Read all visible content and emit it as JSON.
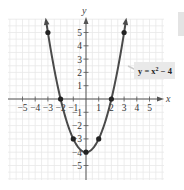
{
  "chart_data": {
    "type": "line",
    "title": "",
    "function": "y = x^2 - 4",
    "xlabel": "x",
    "ylabel": "y",
    "xlim": [
      -5,
      5
    ],
    "ylim": [
      -5,
      5
    ],
    "grid": true,
    "x_ticks": [
      -5,
      -4,
      -3,
      -2,
      -1,
      1,
      2,
      3,
      4,
      5
    ],
    "y_ticks": [
      5,
      4,
      3,
      2,
      1,
      -1,
      -2,
      -3,
      -4,
      -5
    ],
    "x_tick_labels": [
      "−5",
      "−4",
      "−3",
      "−2",
      "−1",
      "1",
      "2",
      "3",
      "4",
      "5"
    ],
    "y_tick_labels": [
      "5",
      "4",
      "3",
      "2",
      "1",
      "−1",
      "−2",
      "−3",
      "−4",
      "−5"
    ],
    "series": [
      {
        "name": "y = x^2 - 4",
        "x": [
          -3,
          -2,
          -1,
          0,
          1,
          2,
          3
        ],
        "values": [
          5,
          0,
          -3,
          -4,
          -3,
          0,
          5
        ],
        "marked_points": true,
        "color": "#4a4a4a"
      }
    ],
    "annotations": [
      {
        "text": "y = x² − 4",
        "points_to": "right branch of parabola"
      }
    ]
  },
  "labels": {
    "x_axis": "x",
    "y_axis": "y",
    "equation_main": "y = x",
    "equation_exp": "2",
    "equation_tail": " − 4"
  },
  "colors": {
    "curve": "#4a4a4a",
    "axis": "#555555",
    "grid": "#e6e6e6",
    "label_box": "#e9e9e9"
  }
}
